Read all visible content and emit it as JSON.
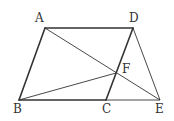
{
  "figure": {
    "type": "geometry",
    "stroke_color": "#333333",
    "points": {
      "A": {
        "x": 45,
        "y": 28,
        "label": "A",
        "lx": 35,
        "ly": 22
      },
      "D": {
        "x": 133,
        "y": 28,
        "label": "D",
        "lx": 129,
        "ly": 22
      },
      "B": {
        "x": 19,
        "y": 100,
        "label": "B",
        "lx": 13,
        "ly": 113
      },
      "C": {
        "x": 106,
        "y": 100,
        "label": "C",
        "lx": 102,
        "ly": 113
      },
      "E": {
        "x": 160,
        "y": 100,
        "label": "E",
        "lx": 155,
        "ly": 113
      },
      "F": {
        "x": 116,
        "y": 73,
        "label": "F",
        "lx": 122,
        "ly": 73
      }
    },
    "thick_segments": [
      [
        "A",
        "D"
      ],
      [
        "A",
        "B"
      ],
      [
        "B",
        "C"
      ],
      [
        "C",
        "D"
      ]
    ],
    "thin_segments": [
      [
        "A",
        "E"
      ],
      [
        "D",
        "E"
      ],
      [
        "C",
        "E"
      ],
      [
        "B",
        "F"
      ]
    ]
  }
}
